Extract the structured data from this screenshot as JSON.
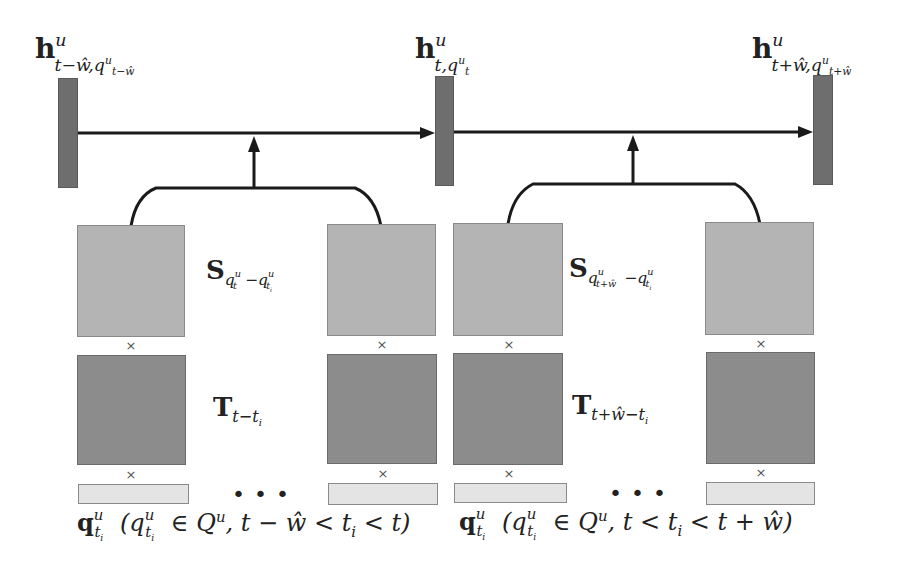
{
  "diagram": {
    "type": "recurrent spatial-temporal aggregation",
    "hidden_states": [
      {
        "id": "h_prev",
        "label_base": "h",
        "label_sup": "u",
        "label_sub": "t−ŵ,q",
        "label_sub_sup": "u",
        "label_sub_sub": "t−ŵ"
      },
      {
        "id": "h_curr",
        "label_base": "h",
        "label_sup": "u",
        "label_sub": "t,q",
        "label_sub_sup": "u",
        "label_sub_sub": "t"
      },
      {
        "id": "h_next",
        "label_base": "h",
        "label_sup": "u",
        "label_sub": "t+ŵ,q",
        "label_sub_sup": "u",
        "label_sub_sub": "t+ŵ"
      }
    ],
    "groups": [
      {
        "spatial_label": {
          "base": "S",
          "sub_q1": "q",
          "sub_q1_sup": "u",
          "sub_q1_sub": "t",
          "minus": "−",
          "sub_q2": "q",
          "sub_q2_sup": "u",
          "sub_q2_sub": "t",
          "sub_q2_sub_sub": "i"
        },
        "temporal_label": {
          "base": "T",
          "sub": "t−t",
          "sub_sub": "i"
        },
        "input_label": {
          "base": "q",
          "sup": "u",
          "sub": "t",
          "sub_sub": "i",
          "condition": "(q",
          "cond_sup": "u",
          "cond_sub": "t",
          "cond_sub_sub": "i",
          "cond_rest": " ∈ Q",
          "cond_Q_sup": "u",
          "cond_tail": ", t − ŵ < t",
          "cond_tail_sub": "i",
          "cond_end": " < t)"
        },
        "multiply_symbol": "×",
        "ellipsis": "•••"
      },
      {
        "spatial_label": {
          "base": "S",
          "sub_q1": "q",
          "sub_q1_sup": "u",
          "sub_q1_sub": "t+ŵ",
          "minus": "−",
          "sub_q2": "q",
          "sub_q2_sup": "u",
          "sub_q2_sub": "t",
          "sub_q2_sub_sub": "i"
        },
        "temporal_label": {
          "base": "T",
          "sub": "t+ŵ−t",
          "sub_sub": "i"
        },
        "input_label": {
          "base": "q",
          "sup": "u",
          "sub": "t",
          "sub_sub": "i",
          "condition": "(q",
          "cond_sup": "u",
          "cond_sub": "t",
          "cond_sub_sub": "i",
          "cond_rest": " ∈ Q",
          "cond_Q_sup": "u",
          "cond_tail": ", t < t",
          "cond_tail_sub": "i",
          "cond_end": " < t + ŵ)"
        },
        "multiply_symbol": "×",
        "ellipsis": "•••"
      }
    ],
    "colors": {
      "hidden_bar": "#6e6e6e",
      "spatial_box": "#b4b4b4",
      "temporal_box": "#8c8c8c",
      "input_bar": "#e4e4e4",
      "line": "#1a1a1a"
    }
  }
}
